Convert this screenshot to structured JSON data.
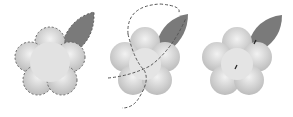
{
  "figure": {
    "panels": [
      {
        "name": "selection-outline",
        "description": "flower and leaf with dashed selection outline"
      },
      {
        "name": "path-outline",
        "description": "flower with dashed circular/leaf construction paths"
      },
      {
        "name": "final-shape",
        "description": "merged flower and leaf shape"
      }
    ],
    "colors": {
      "petal_light": "#eeeeee",
      "petal_dark": "#bdbdbd",
      "leaf": "#7a7a7a",
      "dash": "#555555",
      "background": "#ffffff"
    }
  }
}
